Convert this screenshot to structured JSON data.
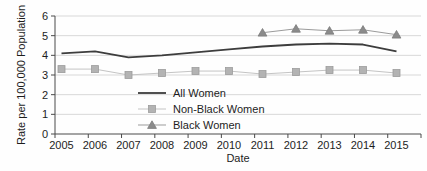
{
  "chart_data": {
    "type": "line",
    "title": "",
    "xlabel": "Date",
    "ylabel": "Rate per 100,000 Population",
    "categories": [
      "2005",
      "2006",
      "2007",
      "2008",
      "2009",
      "2010",
      "2011",
      "2012",
      "2013",
      "2014",
      "2015"
    ],
    "series": [
      {
        "name": "All Women",
        "values": [
          4.1,
          4.2,
          3.9,
          4.0,
          4.15,
          4.3,
          4.45,
          4.55,
          4.6,
          4.55,
          4.2
        ],
        "line_color": "#3d3d3d",
        "line_width": 1.8,
        "marker": "none",
        "marker_color": "#3d3d3d",
        "marker_edge": "#3d3d3d"
      },
      {
        "name": "Non-Black Women",
        "values": [
          3.3,
          3.3,
          3.0,
          3.1,
          3.2,
          3.2,
          3.05,
          3.15,
          3.25,
          3.25,
          3.1
        ],
        "line_color": "#c4c4c4",
        "line_width": 1,
        "marker": "square",
        "marker_color": "#b3b3b3",
        "marker_edge": "#9c9c9c"
      },
      {
        "name": "Black Women",
        "values": [
          null,
          null,
          null,
          null,
          null,
          null,
          5.15,
          5.35,
          5.25,
          5.3,
          5.05
        ],
        "line_color": "#9b9b9b",
        "line_width": 1,
        "marker": "triangle",
        "marker_color": "#8b8b8b",
        "marker_edge": "#7c7c7c"
      }
    ],
    "ylim": [
      0,
      6
    ],
    "yticks": [
      0,
      1,
      2,
      3,
      4,
      5,
      6
    ],
    "grid": "horizontal-only",
    "legend_position": "inside-lower-left",
    "colors": {
      "gridline": "#d8d8d8",
      "axis": "#4a4a4a",
      "text": "#1d1d1d",
      "background": "#ffffff"
    }
  }
}
